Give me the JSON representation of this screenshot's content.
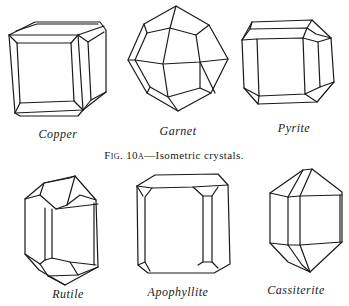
{
  "figure": {
    "caption_prefix": "Fig. 10a",
    "caption_text": "—Isometric crystals.",
    "rows": [
      {
        "name": "isometric",
        "crystals": [
          {
            "label": "Copper"
          },
          {
            "label": "Garnet"
          },
          {
            "label": "Pyrite"
          }
        ]
      },
      {
        "name": "tetragonal",
        "crystals": [
          {
            "label": "Rutile"
          },
          {
            "label": "Apophyllite"
          },
          {
            "label": "Cassiterite"
          }
        ]
      }
    ]
  }
}
